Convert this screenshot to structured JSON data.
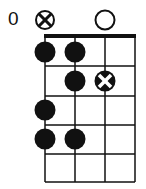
{
  "diagram": {
    "type": "fretboard-chord-diagram",
    "fret_label": "0",
    "strings": 4,
    "frets": 5,
    "open_markers": [
      {
        "string": 1,
        "type": "muted-x-circle"
      },
      {
        "string": 3,
        "type": "open-circle"
      }
    ],
    "dots": [
      {
        "string": 1,
        "fret": 1,
        "type": "filled"
      },
      {
        "string": 2,
        "fret": 1,
        "type": "filled"
      },
      {
        "string": 2,
        "fret": 2,
        "type": "filled"
      },
      {
        "string": 3,
        "fret": 2,
        "type": "x-filled"
      },
      {
        "string": 1,
        "fret": 3,
        "type": "filled"
      },
      {
        "string": 1,
        "fret": 4,
        "type": "filled"
      },
      {
        "string": 2,
        "fret": 4,
        "type": "filled"
      }
    ]
  }
}
